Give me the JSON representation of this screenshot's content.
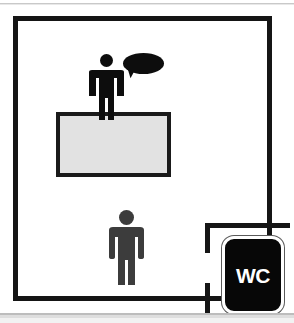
{
  "scene": {
    "title": "Service counter floor plan pictogram",
    "width": 294,
    "height": 323,
    "background_color": "#ffffff"
  },
  "room": {
    "name": "main-room",
    "wall_color": "#151515",
    "wall_thickness": 5,
    "fill_color": "#ffffff"
  },
  "counter": {
    "name": "service-counter",
    "fill_color": "#e2e2e2",
    "border_color": "#1a1a1a",
    "label": ""
  },
  "figures": [
    {
      "id": "staff",
      "role": "staff-behind-counter",
      "color": "#0d0d0d",
      "has_speech_bubble": true
    },
    {
      "id": "customer",
      "role": "customer-standing",
      "color": "#3c3c3c",
      "has_speech_bubble": false
    }
  ],
  "speech_bubble": {
    "name": "speech-bubble",
    "color": "#0d0d0d",
    "text": "",
    "tail_direction": "down-left"
  },
  "wc_room": {
    "name": "wc-room",
    "wall_color": "#151515",
    "door_gap": true,
    "sign": {
      "label": "WC",
      "background_color": "#070707",
      "text_color": "#ffffff",
      "border_color": "#ffffff"
    }
  },
  "edges": {
    "top_band_color": "#c9c9c9",
    "bottom_band_color": "#bdbdbd"
  }
}
